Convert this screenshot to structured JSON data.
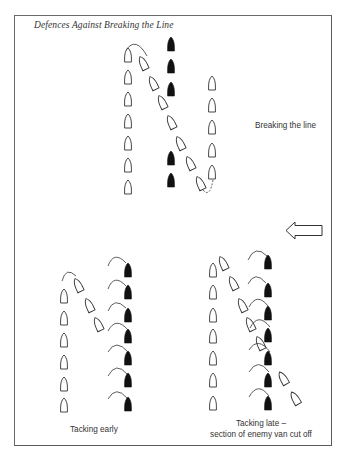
{
  "title": "Defences Against Breaking the Line",
  "labels": {
    "breaking": "Breaking the line",
    "early": "Tacking early",
    "late_line1": "Tacking late –",
    "late_line2": "section of enemy van cut off"
  },
  "colors": {
    "ink": "#333333",
    "frame": "#5a5a5a",
    "friendly_fill": "#ffffff",
    "enemy_fill": "#111111"
  },
  "legend_icons": {
    "white_ship": "ship-outline-icon",
    "black_ship": "ship-filled-icon",
    "wind_arrow": "arrow-left-icon"
  },
  "diagrams": [
    {
      "id": "breaking-the-line",
      "white_ships": [
        [
          128,
          55,
          0
        ],
        [
          128,
          77,
          0
        ],
        [
          128,
          99,
          0
        ],
        [
          128,
          121,
          0
        ],
        [
          128,
          143,
          0
        ],
        [
          128,
          165,
          0
        ],
        [
          128,
          187,
          0
        ],
        [
          143,
          63,
          -25
        ],
        [
          153,
          83,
          -25
        ],
        [
          162,
          102,
          -25
        ],
        [
          171,
          122,
          -25
        ],
        [
          180,
          143,
          -25
        ],
        [
          190,
          163,
          -25
        ],
        [
          200,
          183,
          -25
        ],
        [
          212,
          83,
          0
        ],
        [
          212,
          105,
          0
        ],
        [
          212,
          127,
          0
        ],
        [
          212,
          150,
          0
        ],
        [
          212,
          172,
          0
        ]
      ],
      "black_ships": [
        [
          171,
          44
        ],
        [
          171,
          66
        ],
        [
          171,
          89
        ],
        [
          171,
          158
        ],
        [
          171,
          180
        ]
      ],
      "arcs": [
        {
          "d": "M126,50 Q136,36 147,56",
          "dashed": false
        }
      ],
      "dashed_paths": [
        {
          "d": "M203,190 Q210,198 213,180"
        }
      ]
    },
    {
      "id": "tacking-early",
      "white_ships": [
        [
          64,
          296,
          0
        ],
        [
          64,
          318,
          0
        ],
        [
          64,
          340,
          0
        ],
        [
          64,
          362,
          0
        ],
        [
          64,
          384,
          0
        ],
        [
          64,
          405,
          0
        ],
        [
          78,
          285,
          -25
        ],
        [
          89,
          305,
          -25
        ],
        [
          98,
          324,
          -25
        ]
      ],
      "black_ships": [
        [
          128,
          270
        ],
        [
          128,
          292
        ],
        [
          128,
          315
        ],
        [
          128,
          336
        ],
        [
          128,
          358
        ],
        [
          128,
          380
        ],
        [
          128,
          404
        ]
      ],
      "arcs": [
        {
          "d": "M62,281 Q66,266 76,276",
          "dashed": false
        },
        {
          "d": "M108,266 Q114,250 126,263",
          "dashed": false
        },
        {
          "d": "M108,289 Q114,273 126,286",
          "dashed": false
        },
        {
          "d": "M108,311 Q114,296 126,308",
          "dashed": false
        },
        {
          "d": "M108,331 Q116,316 128,330",
          "dashed": false
        },
        {
          "d": "M108,352 Q116,338 128,352",
          "dashed": false
        },
        {
          "d": "M108,376 Q116,361 127,374",
          "dashed": false
        },
        {
          "d": "M108,399 Q116,385 127,398",
          "dashed": false
        }
      ]
    },
    {
      "id": "tacking-late",
      "white_ships": [
        [
          213,
          270,
          0
        ],
        [
          213,
          292,
          0
        ],
        [
          213,
          315,
          0
        ],
        [
          213,
          336,
          0
        ],
        [
          213,
          358,
          0
        ],
        [
          213,
          380,
          0
        ],
        [
          213,
          403,
          0
        ],
        [
          223,
          263,
          -25
        ],
        [
          233,
          283,
          -25
        ],
        [
          242,
          305,
          -25
        ],
        [
          250,
          324,
          -25
        ],
        [
          260,
          343,
          -25
        ],
        [
          283,
          378,
          -30
        ],
        [
          295,
          398,
          -30
        ]
      ],
      "black_ships": [
        [
          268,
          262
        ],
        [
          268,
          290
        ],
        [
          268,
          313
        ],
        [
          268,
          335
        ],
        [
          268,
          358
        ],
        [
          268,
          380
        ],
        [
          268,
          403
        ]
      ],
      "arcs": [
        {
          "d": "M248,260 Q255,244 267,256",
          "dashed": false
        },
        {
          "d": "M248,284 Q255,270 266,283",
          "dashed": false
        },
        {
          "d": "M249,307 Q257,292 268,306",
          "dashed": false
        },
        {
          "d": "M250,328 Q258,312 270,327",
          "dashed": false
        },
        {
          "d": "M249,350 Q258,336 270,352",
          "dashed": false
        },
        {
          "d": "M249,372 Q258,357 269,372",
          "dashed": false
        },
        {
          "d": "M249,397 Q258,381 269,396",
          "dashed": false
        }
      ]
    }
  ],
  "wind_arrow": {
    "x": 286,
    "y": 222,
    "width": 36,
    "height": 17
  }
}
